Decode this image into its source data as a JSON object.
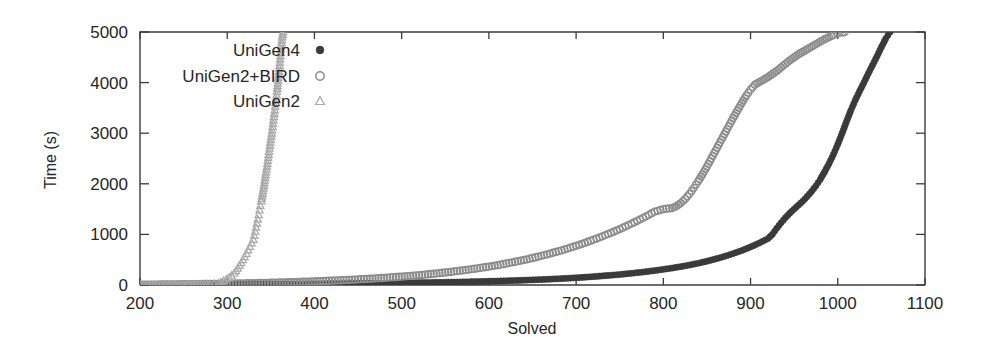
{
  "chart_data": {
    "type": "scatter",
    "title": "",
    "subtitle": "",
    "xlabel": "Solved",
    "ylabel": "Time (s)",
    "xlim": [
      200,
      1100
    ],
    "ylim": [
      0,
      5000
    ],
    "xticks": [
      200,
      300,
      400,
      500,
      600,
      700,
      800,
      900,
      1000,
      1100
    ],
    "xtick_labels": [
      "200",
      "300",
      "400",
      "500",
      "600",
      "700",
      "800",
      "900",
      "1000",
      "1100"
    ],
    "yticks": [
      0,
      1000,
      2000,
      3000,
      4000,
      5000
    ],
    "ytick_labels": [
      "0",
      "1000",
      "2000",
      "3000",
      "4000",
      "5000"
    ],
    "grid": false,
    "legend_position": "upper-left-inside",
    "legend_entries": [
      "UniGen4",
      "UniGen2+BIRD",
      "UniGen2"
    ],
    "series": [
      {
        "name": "UniGen4",
        "marker": "filled-circle",
        "color": "#3a3a3a",
        "marker_size": 3.1,
        "points": [
          [
            200,
            4
          ],
          [
            210,
            5
          ],
          [
            220,
            6
          ],
          [
            230,
            7
          ],
          [
            240,
            8
          ],
          [
            250,
            9
          ],
          [
            260,
            10
          ],
          [
            270,
            11
          ],
          [
            280,
            12
          ],
          [
            290,
            13
          ],
          [
            300,
            14
          ],
          [
            310,
            15
          ],
          [
            320,
            16
          ],
          [
            330,
            17
          ],
          [
            340,
            18
          ],
          [
            350,
            19
          ],
          [
            360,
            20
          ],
          [
            370,
            21
          ],
          [
            380,
            22
          ],
          [
            390,
            23
          ],
          [
            400,
            24
          ],
          [
            410,
            25
          ],
          [
            420,
            27
          ],
          [
            430,
            28
          ],
          [
            440,
            30
          ],
          [
            450,
            31
          ],
          [
            460,
            33
          ],
          [
            470,
            35
          ],
          [
            480,
            37
          ],
          [
            490,
            39
          ],
          [
            500,
            41
          ],
          [
            510,
            43
          ],
          [
            520,
            46
          ],
          [
            530,
            48
          ],
          [
            540,
            51
          ],
          [
            550,
            54
          ],
          [
            560,
            57
          ],
          [
            570,
            61
          ],
          [
            580,
            65
          ],
          [
            590,
            69
          ],
          [
            600,
            73
          ],
          [
            610,
            78
          ],
          [
            620,
            83
          ],
          [
            630,
            89
          ],
          [
            640,
            95
          ],
          [
            650,
            101
          ],
          [
            660,
            108
          ],
          [
            670,
            116
          ],
          [
            680,
            124
          ],
          [
            690,
            133
          ],
          [
            700,
            143
          ],
          [
            710,
            154
          ],
          [
            720,
            166
          ],
          [
            730,
            179
          ],
          [
            740,
            193
          ],
          [
            750,
            208
          ],
          [
            760,
            225
          ],
          [
            770,
            243
          ],
          [
            780,
            263
          ],
          [
            790,
            285
          ],
          [
            800,
            309
          ],
          [
            810,
            335
          ],
          [
            820,
            363
          ],
          [
            830,
            395
          ],
          [
            840,
            430
          ],
          [
            850,
            470
          ],
          [
            860,
            515
          ],
          [
            870,
            565
          ],
          [
            880,
            620
          ],
          [
            890,
            682
          ],
          [
            900,
            752
          ],
          [
            910,
            830
          ],
          [
            920,
            918
          ],
          [
            925,
            1000
          ],
          [
            930,
            1120
          ],
          [
            935,
            1230
          ],
          [
            940,
            1330
          ],
          [
            945,
            1420
          ],
          [
            950,
            1500
          ],
          [
            955,
            1580
          ],
          [
            960,
            1660
          ],
          [
            965,
            1750
          ],
          [
            970,
            1850
          ],
          [
            975,
            1960
          ],
          [
            980,
            2090
          ],
          [
            985,
            2240
          ],
          [
            990,
            2400
          ],
          [
            995,
            2580
          ],
          [
            1000,
            2780
          ],
          [
            1005,
            3000
          ],
          [
            1010,
            3230
          ],
          [
            1015,
            3450
          ],
          [
            1020,
            3650
          ],
          [
            1025,
            3830
          ],
          [
            1030,
            4000
          ],
          [
            1035,
            4180
          ],
          [
            1040,
            4350
          ],
          [
            1045,
            4520
          ],
          [
            1050,
            4700
          ],
          [
            1055,
            4870
          ],
          [
            1060,
            5000
          ]
        ]
      },
      {
        "name": "UniGen2+BIRD",
        "marker": "open-circle",
        "color": "#8c8c8c",
        "marker_size": 3.4,
        "points": [
          [
            200,
            5
          ],
          [
            210,
            7
          ],
          [
            220,
            9
          ],
          [
            230,
            11
          ],
          [
            240,
            13
          ],
          [
            250,
            15
          ],
          [
            260,
            17
          ],
          [
            270,
            19
          ],
          [
            280,
            21
          ],
          [
            290,
            24
          ],
          [
            300,
            27
          ],
          [
            310,
            30
          ],
          [
            320,
            33
          ],
          [
            330,
            37
          ],
          [
            340,
            41
          ],
          [
            350,
            45
          ],
          [
            360,
            50
          ],
          [
            370,
            55
          ],
          [
            380,
            60
          ],
          [
            390,
            66
          ],
          [
            400,
            72
          ],
          [
            410,
            79
          ],
          [
            420,
            86
          ],
          [
            430,
            94
          ],
          [
            440,
            102
          ],
          [
            450,
            111
          ],
          [
            460,
            121
          ],
          [
            470,
            131
          ],
          [
            480,
            142
          ],
          [
            490,
            154
          ],
          [
            500,
            167
          ],
          [
            510,
            181
          ],
          [
            520,
            196
          ],
          [
            530,
            212
          ],
          [
            540,
            229
          ],
          [
            550,
            248
          ],
          [
            560,
            268
          ],
          [
            570,
            290
          ],
          [
            580,
            313
          ],
          [
            590,
            338
          ],
          [
            600,
            365
          ],
          [
            610,
            394
          ],
          [
            620,
            425
          ],
          [
            630,
            459
          ],
          [
            640,
            495
          ],
          [
            650,
            534
          ],
          [
            660,
            576
          ],
          [
            670,
            621
          ],
          [
            680,
            669
          ],
          [
            690,
            720
          ],
          [
            700,
            775
          ],
          [
            710,
            834
          ],
          [
            720,
            896
          ],
          [
            730,
            962
          ],
          [
            740,
            1032
          ],
          [
            750,
            1106
          ],
          [
            760,
            1185
          ],
          [
            770,
            1268
          ],
          [
            780,
            1356
          ],
          [
            790,
            1449
          ],
          [
            800,
            1500
          ],
          [
            810,
            1520
          ],
          [
            815,
            1560
          ],
          [
            820,
            1620
          ],
          [
            825,
            1700
          ],
          [
            830,
            1800
          ],
          [
            835,
            1920
          ],
          [
            840,
            2050
          ],
          [
            845,
            2190
          ],
          [
            850,
            2340
          ],
          [
            855,
            2500
          ],
          [
            860,
            2660
          ],
          [
            865,
            2820
          ],
          [
            870,
            2980
          ],
          [
            875,
            3140
          ],
          [
            880,
            3300
          ],
          [
            885,
            3450
          ],
          [
            890,
            3600
          ],
          [
            895,
            3740
          ],
          [
            900,
            3860
          ],
          [
            905,
            3960
          ],
          [
            910,
            4010
          ],
          [
            915,
            4060
          ],
          [
            920,
            4110
          ],
          [
            925,
            4170
          ],
          [
            930,
            4230
          ],
          [
            935,
            4300
          ],
          [
            940,
            4370
          ],
          [
            945,
            4440
          ],
          [
            950,
            4500
          ],
          [
            955,
            4560
          ],
          [
            960,
            4610
          ],
          [
            965,
            4660
          ],
          [
            970,
            4710
          ],
          [
            975,
            4760
          ],
          [
            980,
            4810
          ],
          [
            985,
            4860
          ],
          [
            990,
            4900
          ],
          [
            995,
            4940
          ],
          [
            1000,
            4970
          ],
          [
            1005,
            4990
          ],
          [
            1008,
            5000
          ]
        ]
      },
      {
        "name": "UniGen2",
        "marker": "small-triangle",
        "color": "#a8a8a8",
        "marker_size": 3.0,
        "points": [
          [
            200,
            3
          ],
          [
            210,
            4
          ],
          [
            220,
            5
          ],
          [
            230,
            6
          ],
          [
            240,
            7
          ],
          [
            250,
            9
          ],
          [
            260,
            11
          ],
          [
            270,
            14
          ],
          [
            280,
            18
          ],
          [
            285,
            25
          ],
          [
            290,
            40
          ],
          [
            293,
            60
          ],
          [
            296,
            85
          ],
          [
            299,
            115
          ],
          [
            302,
            150
          ],
          [
            305,
            190
          ],
          [
            308,
            235
          ],
          [
            310,
            280
          ],
          [
            312,
            330
          ],
          [
            314,
            385
          ],
          [
            316,
            440
          ],
          [
            318,
            500
          ],
          [
            320,
            560
          ],
          [
            322,
            620
          ],
          [
            324,
            690
          ],
          [
            326,
            760
          ],
          [
            328,
            830
          ],
          [
            330,
            900
          ],
          [
            331,
            980
          ],
          [
            332,
            1060
          ],
          [
            333,
            1140
          ],
          [
            334,
            1220
          ],
          [
            335,
            1300
          ],
          [
            336,
            1390
          ],
          [
            337,
            1480
          ],
          [
            338,
            1570
          ],
          [
            339,
            1660
          ],
          [
            340,
            1760
          ],
          [
            341,
            1860
          ],
          [
            342,
            1960
          ],
          [
            343,
            2070
          ],
          [
            344,
            2180
          ],
          [
            345,
            2290
          ],
          [
            346,
            2400
          ],
          [
            347,
            2520
          ],
          [
            348,
            2640
          ],
          [
            349,
            2760
          ],
          [
            350,
            2880
          ],
          [
            351,
            3000
          ],
          [
            352,
            3130
          ],
          [
            353,
            3260
          ],
          [
            354,
            3390
          ],
          [
            355,
            3530
          ],
          [
            356,
            3680
          ],
          [
            357,
            3830
          ],
          [
            358,
            3990
          ],
          [
            359,
            4160
          ],
          [
            360,
            4340
          ],
          [
            361,
            4530
          ],
          [
            362,
            4730
          ],
          [
            363,
            4900
          ],
          [
            364,
            5000
          ]
        ]
      }
    ]
  },
  "plot_geometry": {
    "left_px": 140,
    "right_px": 925,
    "top_px": 32,
    "bottom_px": 285
  },
  "legend": {
    "rows": [
      {
        "label": "UniGen4",
        "marker": "filled-circle"
      },
      {
        "label": "UniGen2+BIRD",
        "marker": "open-circle"
      },
      {
        "label": "UniGen2",
        "marker": "small-triangle"
      }
    ],
    "label_right_px": 300,
    "marker_x_px": 320,
    "row_y_px": [
      50,
      76,
      101
    ]
  },
  "colors": {
    "axis": "#3b3b3b",
    "text": "#262626",
    "series_unigen4": "#3a3a3a",
    "series_unigen2_bird": "#8c8c8c",
    "series_unigen2": "#a8a8a8",
    "background": "#ffffff"
  }
}
